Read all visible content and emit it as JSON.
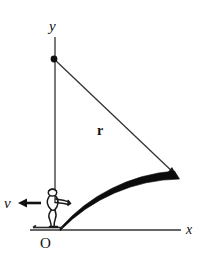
{
  "figure": {
    "background_color": "#ffffff",
    "ink_color": "#111111",
    "width": 208,
    "height": 260
  },
  "labels": {
    "y_axis": "y",
    "x_axis": "x",
    "radius": "r",
    "velocity": "v",
    "origin": "O"
  },
  "geometry": {
    "origin_point": {
      "x": 56,
      "y": 230
    },
    "pivot_point": {
      "x": 54,
      "y": 59
    },
    "arc_end_point": {
      "x": 177,
      "y": 176
    },
    "y_axis_top": {
      "x": 55,
      "y": 37
    },
    "y_axis_bottom": {
      "x": 55,
      "y": 202
    },
    "x_axis_left": {
      "x": 30,
      "y": 230
    },
    "x_axis_right": {
      "x": 181,
      "y": 230
    },
    "radius_length_px": 170,
    "velocity_arrow": {
      "from_x": 40,
      "from_y": 203,
      "to_x": 19,
      "to_y": 203
    },
    "ski_line": {
      "from_x": 33,
      "from_y": 227,
      "to_x": 63,
      "to_y": 227
    },
    "skier_center": {
      "x": 52,
      "y": 208
    }
  },
  "elements": {
    "y_axis_name": "vertical-axis",
    "x_axis_name": "horizontal-axis",
    "radius_name": "radius-line",
    "arc_name": "curved-slope",
    "skier_name": "skier-figure",
    "pivot_name": "pivot-dot",
    "velocity_name": "velocity-arrow"
  }
}
